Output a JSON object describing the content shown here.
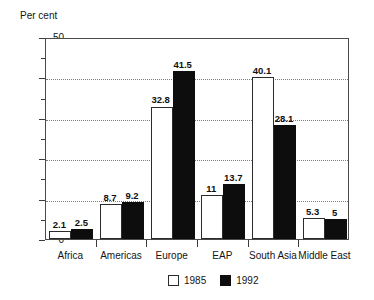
{
  "chart_data": {
    "type": "bar",
    "title": "",
    "ylabel": "Per cent",
    "xlabel": "",
    "ylim": [
      0,
      50
    ],
    "ytick_step": 10,
    "yticks": [
      0,
      10,
      20,
      30,
      40,
      50
    ],
    "ytick_labels": [
      "0",
      "10",
      "20",
      "30",
      "40",
      "50"
    ],
    "minor_tick_step": 5,
    "grid": true,
    "grid_axis": "y",
    "grid_style": "dotted",
    "legend_position": "bottom-center",
    "categories": [
      "Africa",
      "Americas",
      "Europe",
      "EAP",
      "South Asia",
      "Middle East"
    ],
    "series": [
      {
        "name": "1985",
        "color": "#ffffff",
        "edge_color": "#2b2b2b",
        "values": [
          2.1,
          8.7,
          32.8,
          11,
          40.1,
          5.3
        ],
        "value_labels": [
          "2.1",
          "8.7",
          "32.8",
          "11",
          "40.1",
          "5.3"
        ]
      },
      {
        "name": "1992",
        "color": "#0d0d0d",
        "edge_color": "#0d0d0d",
        "values": [
          2.5,
          9.2,
          41.5,
          13.7,
          28.1,
          5
        ],
        "value_labels": [
          "2.5",
          "9.2",
          "41.5",
          "13.7",
          "28.1",
          "5"
        ]
      }
    ]
  },
  "legend": {
    "items": [
      {
        "label": "1985",
        "swatch": "white-square"
      },
      {
        "label": "1992",
        "swatch": "black-square"
      }
    ]
  }
}
